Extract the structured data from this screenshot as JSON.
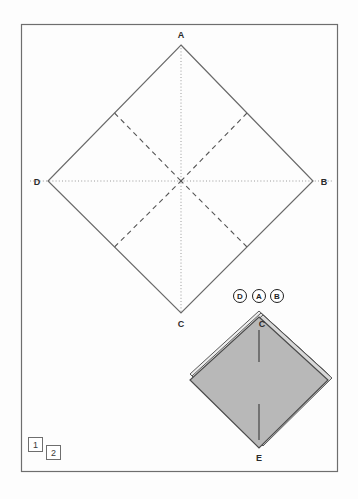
{
  "page": {
    "background_color": "#fdfdfd",
    "frame_color": "#6e6e6e"
  },
  "diagram": {
    "fold_line_color": "#555555",
    "axis_line_color": "#9a9a9a",
    "outline_color": "#6a6a6a",
    "paper_fill_color": "#b8b8b8",
    "paper_edge_color": "#4a4a4a"
  },
  "figure1": {
    "name": "unfolded-square-crease-pattern",
    "vertices": [
      {
        "id": "A",
        "label": "A",
        "x": 181,
        "y": 45,
        "label_x": 181,
        "label_y": 38
      },
      {
        "id": "B",
        "label": "B",
        "x": 313,
        "y": 181,
        "label_x": 324,
        "label_y": 185
      },
      {
        "id": "C",
        "label": "C",
        "x": 181,
        "y": 313,
        "label_x": 181,
        "label_y": 327
      },
      {
        "id": "D",
        "label": "D",
        "x": 48,
        "y": 181,
        "label_x": 37,
        "label_y": 185
      }
    ],
    "center": {
      "x": 181,
      "y": 181
    },
    "edge_midpoints": [
      {
        "id": "mid-AD",
        "x": 114.5,
        "y": 113
      },
      {
        "id": "mid-AB",
        "x": 247,
        "y": 113
      },
      {
        "id": "mid-BC",
        "x": 247,
        "y": 247
      },
      {
        "id": "mid-CD",
        "x": 114.5,
        "y": 247
      }
    ],
    "axis_lines": [
      {
        "id": "vertical-axis-AC",
        "style": "dotted"
      },
      {
        "id": "horizontal-axis-DB",
        "style": "dotted"
      }
    ],
    "crease_style": "dashed"
  },
  "figure2": {
    "name": "folded-square-base",
    "vertices": [
      {
        "id": "C",
        "label": "C",
        "x": 259,
        "y": 317,
        "label_x": 262,
        "label_y": 326
      },
      {
        "id": "E",
        "label": "E",
        "x": 259,
        "y": 448,
        "label_x": 259,
        "label_y": 460
      }
    ],
    "left_corner": {
      "x": 190,
      "y": 374
    },
    "right_corner": {
      "x": 328,
      "y": 374
    },
    "flap_labels": [
      {
        "id": "flap-D",
        "label": "D",
        "cx": 240,
        "cy": 296
      },
      {
        "id": "flap-A",
        "label": "A",
        "cx": 259,
        "cy": 296
      },
      {
        "id": "flap-B",
        "label": "B",
        "cx": 277,
        "cy": 296
      }
    ],
    "interior_lines": [
      {
        "id": "upper-center-line",
        "x": 259,
        "y1": 330,
        "y2": 362
      },
      {
        "id": "lower-center-line",
        "x": 259,
        "y1": 404,
        "y2": 440
      }
    ],
    "layer_count": 3
  },
  "steps": [
    {
      "id": "step-1",
      "label": "1",
      "x": 28,
      "y": 437,
      "size": 14
    },
    {
      "id": "step-2",
      "label": "2",
      "x": 46,
      "y": 445,
      "size": 14
    }
  ]
}
